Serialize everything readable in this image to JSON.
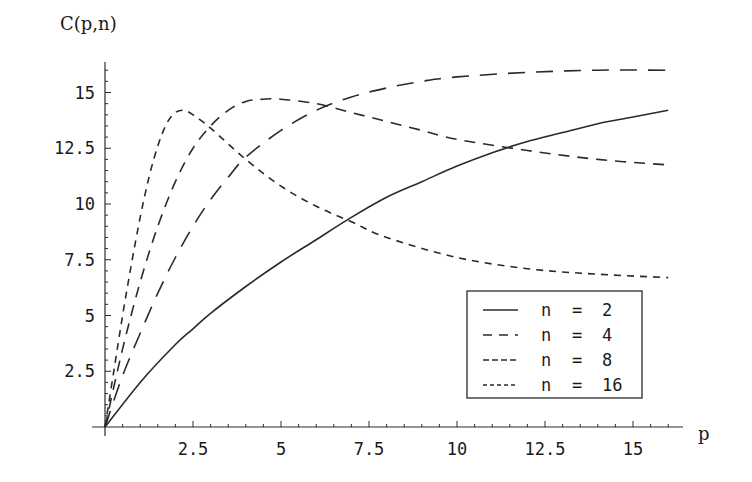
{
  "chart_data": {
    "type": "line",
    "title": "",
    "xlabel": "p",
    "ylabel": "C(p,n)",
    "xlim": [
      0,
      16.2
    ],
    "ylim": [
      0,
      16.5
    ],
    "grid": false,
    "legend_position": "lower right",
    "x_ticks": [
      2.5,
      5,
      7.5,
      10,
      12.5,
      15
    ],
    "x_tick_labels": [
      "2.5",
      "5",
      "7.5",
      "10",
      "12.5",
      "15"
    ],
    "y_ticks": [
      2.5,
      5,
      7.5,
      10,
      12.5,
      15
    ],
    "y_tick_labels": [
      "2.5",
      "5",
      "7.5",
      "10",
      "12.5",
      "15"
    ],
    "series": [
      {
        "name": "n = 2",
        "style": "solid",
        "points": [
          [
            0,
            0
          ],
          [
            1,
            2.0
          ],
          [
            2,
            3.7
          ],
          [
            2.5,
            4.4
          ],
          [
            3,
            5.1
          ],
          [
            4,
            6.3
          ],
          [
            5,
            7.4
          ],
          [
            6,
            8.4
          ],
          [
            7,
            9.4
          ],
          [
            8,
            10.3
          ],
          [
            9,
            11.0
          ],
          [
            10,
            11.7
          ],
          [
            11,
            12.3
          ],
          [
            12,
            12.8
          ],
          [
            13,
            13.2
          ],
          [
            14,
            13.6
          ],
          [
            15,
            13.9
          ],
          [
            16,
            14.2
          ]
        ]
      },
      {
        "name": "n = 4",
        "style": "long-dash",
        "points": [
          [
            0,
            0
          ],
          [
            0.5,
            2.3
          ],
          [
            1,
            4.2
          ],
          [
            1.5,
            6.0
          ],
          [
            2,
            7.6
          ],
          [
            2.5,
            9.0
          ],
          [
            3,
            10.2
          ],
          [
            3.5,
            11.2
          ],
          [
            4,
            12.1
          ],
          [
            5,
            13.3
          ],
          [
            6,
            14.2
          ],
          [
            7,
            14.8
          ],
          [
            8,
            15.2
          ],
          [
            9,
            15.5
          ],
          [
            10,
            15.7
          ],
          [
            12,
            15.9
          ],
          [
            14,
            16.0
          ],
          [
            16,
            16.0
          ]
        ]
      },
      {
        "name": "n = 8",
        "style": "medium-dash",
        "points": [
          [
            0,
            0
          ],
          [
            0.5,
            3.5
          ],
          [
            1,
            6.5
          ],
          [
            1.5,
            9.0
          ],
          [
            2,
            11.0
          ],
          [
            2.5,
            12.5
          ],
          [
            3,
            13.5
          ],
          [
            3.5,
            14.2
          ],
          [
            4,
            14.6
          ],
          [
            4.5,
            14.7
          ],
          [
            5,
            14.7
          ],
          [
            6,
            14.5
          ],
          [
            7,
            14.1
          ],
          [
            8,
            13.7
          ],
          [
            9,
            13.3
          ],
          [
            10,
            12.9
          ],
          [
            12,
            12.4
          ],
          [
            14,
            12.0
          ],
          [
            16,
            11.75
          ]
        ]
      },
      {
        "name": "n = 16",
        "style": "short-dash",
        "points": [
          [
            0,
            0
          ],
          [
            0.25,
            2.5
          ],
          [
            0.5,
            5.0
          ],
          [
            0.75,
            7.3
          ],
          [
            1,
            9.4
          ],
          [
            1.25,
            11.2
          ],
          [
            1.5,
            12.6
          ],
          [
            1.75,
            13.6
          ],
          [
            2,
            14.1
          ],
          [
            2.25,
            14.2
          ],
          [
            2.5,
            14.0
          ],
          [
            3,
            13.4
          ],
          [
            4,
            12.0
          ],
          [
            5,
            10.8
          ],
          [
            6,
            9.9
          ],
          [
            7,
            9.2
          ],
          [
            8,
            8.5
          ],
          [
            10,
            7.6
          ],
          [
            12,
            7.1
          ],
          [
            14,
            6.85
          ],
          [
            16,
            6.7
          ]
        ]
      }
    ],
    "legend": {
      "entries": [
        {
          "label_var": "n",
          "label_eq": "=",
          "label_val": "2",
          "style": "solid"
        },
        {
          "label_var": "n",
          "label_eq": "=",
          "label_val": "4",
          "style": "long-dash"
        },
        {
          "label_var": "n",
          "label_eq": "=",
          "label_val": "8",
          "style": "medium-dash"
        },
        {
          "label_var": "n",
          "label_eq": "=",
          "label_val": "16",
          "style": "short-dash"
        }
      ]
    },
    "colors": {
      "line": "#2a2a2a",
      "axis": "#2a2a2a",
      "background": "#ffffff"
    }
  }
}
